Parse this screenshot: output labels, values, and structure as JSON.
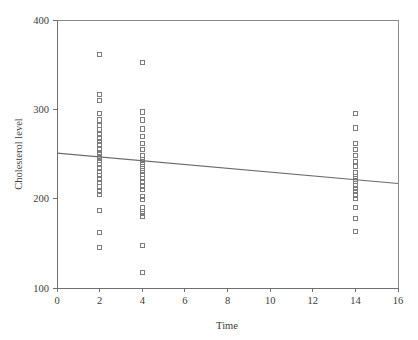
{
  "chart_data": {
    "type": "scatter",
    "title": "",
    "xlabel": "Time",
    "ylabel": "Cholesterol level",
    "xlim": [
      0,
      16
    ],
    "ylim": [
      100,
      400
    ],
    "xticks": [
      0,
      2,
      4,
      6,
      8,
      10,
      12,
      14,
      16
    ],
    "yticks": [
      100,
      200,
      300,
      400
    ],
    "grid": false,
    "legend": null,
    "marker": "open-square",
    "series": [
      {
        "name": "Cholesterol measurements",
        "points": [
          [
            2,
            361
          ],
          [
            2,
            317
          ],
          [
            2,
            310
          ],
          [
            2,
            295
          ],
          [
            2,
            288
          ],
          [
            2,
            282
          ],
          [
            2,
            277
          ],
          [
            2,
            272
          ],
          [
            2,
            268
          ],
          [
            2,
            264
          ],
          [
            2,
            260
          ],
          [
            2,
            256
          ],
          [
            2,
            252
          ],
          [
            2,
            249
          ],
          [
            2,
            246
          ],
          [
            2,
            243
          ],
          [
            2,
            240
          ],
          [
            2,
            251
          ],
          [
            2,
            247
          ],
          [
            2,
            238
          ],
          [
            2,
            234
          ],
          [
            2,
            230
          ],
          [
            2,
            226
          ],
          [
            2,
            222
          ],
          [
            2,
            218
          ],
          [
            2,
            214
          ],
          [
            2,
            208
          ],
          [
            2,
            205
          ],
          [
            2,
            187
          ],
          [
            2,
            162
          ],
          [
            2,
            145
          ],
          [
            4,
            352
          ],
          [
            4,
            297
          ],
          [
            4,
            288
          ],
          [
            4,
            278
          ],
          [
            4,
            270
          ],
          [
            4,
            262
          ],
          [
            4,
            255
          ],
          [
            4,
            248
          ],
          [
            4,
            244
          ],
          [
            4,
            241
          ],
          [
            4,
            238
          ],
          [
            4,
            234
          ],
          [
            4,
            231
          ],
          [
            4,
            227
          ],
          [
            4,
            223
          ],
          [
            4,
            219
          ],
          [
            4,
            214
          ],
          [
            4,
            210
          ],
          [
            4,
            202
          ],
          [
            4,
            199
          ],
          [
            4,
            190
          ],
          [
            4,
            186
          ],
          [
            4,
            183
          ],
          [
            4,
            180
          ],
          [
            4,
            148
          ],
          [
            4,
            117
          ],
          [
            14,
            295
          ],
          [
            14,
            279
          ],
          [
            14,
            262
          ],
          [
            14,
            255
          ],
          [
            14,
            248
          ],
          [
            14,
            242
          ],
          [
            14,
            236
          ],
          [
            14,
            229
          ],
          [
            14,
            225
          ],
          [
            14,
            222
          ],
          [
            14,
            219
          ],
          [
            14,
            215
          ],
          [
            14,
            211
          ],
          [
            14,
            208
          ],
          [
            14,
            204
          ],
          [
            14,
            200
          ],
          [
            14,
            190
          ],
          [
            14,
            178
          ],
          [
            14,
            163
          ]
        ]
      }
    ],
    "fit_line": {
      "name": "regression-line",
      "x_start": 0,
      "y_start": 251,
      "x_end": 16,
      "y_end": 217
    }
  },
  "axes": {
    "x_label": "Time",
    "y_label": "Cholesterol level",
    "x_tick_labels": [
      "0",
      "2",
      "4",
      "6",
      "8",
      "10",
      "12",
      "14",
      "16"
    ],
    "y_tick_labels": [
      "100",
      "200",
      "300",
      "400"
    ]
  },
  "colors": {
    "marker_stroke": "#7d7d7d",
    "fit_line": "#6b6b6b",
    "axis": "#6f6f6f",
    "frame": "#8a8a8a",
    "text": "#3b3b3b",
    "background": "#ffffff"
  }
}
